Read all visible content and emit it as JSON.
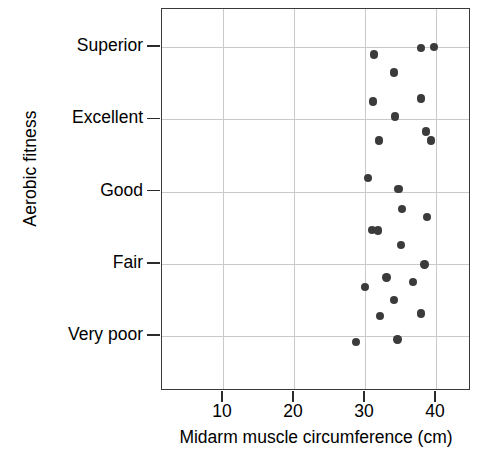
{
  "chart_data": {
    "type": "scatter",
    "title": "",
    "xlabel": "Midarm muscle circumference (cm)",
    "ylabel": "Aerobic fitness",
    "xlim": [
      0,
      43.5
    ],
    "ylim": [
      0.4,
      5.9
    ],
    "grid": true,
    "legend": "none",
    "marker_color": "#3b3b3b",
    "xticks": [
      10,
      20,
      30,
      40
    ],
    "xtick_labels": [
      "10",
      "20",
      "30",
      "40"
    ],
    "yticks": [
      1,
      2,
      3,
      4,
      5
    ],
    "ytick_labels": [
      "Very poor",
      "Fair",
      "Good",
      "Excellent",
      "Superior"
    ],
    "y_categories": [
      "Very poor",
      "Fair",
      "Good",
      "Excellent",
      "Superior"
    ],
    "points": [
      {
        "x": 39.7,
        "y": 5.0,
        "category": "Superior"
      },
      {
        "x": 37.9,
        "y": 4.99,
        "category": "Superior"
      },
      {
        "x": 31.3,
        "y": 4.9,
        "category": "Superior"
      },
      {
        "x": 34.1,
        "y": 4.65,
        "category": "Superior"
      },
      {
        "x": 37.9,
        "y": 4.29,
        "category": "Excellent"
      },
      {
        "x": 31.1,
        "y": 4.25,
        "category": "Excellent"
      },
      {
        "x": 34.2,
        "y": 4.04,
        "category": "Excellent"
      },
      {
        "x": 39.3,
        "y": 3.71,
        "category": "Good"
      },
      {
        "x": 32.0,
        "y": 3.71,
        "category": "Good"
      },
      {
        "x": 38.6,
        "y": 3.83,
        "category": "Good"
      },
      {
        "x": 30.4,
        "y": 3.19,
        "category": "Good"
      },
      {
        "x": 34.7,
        "y": 3.04,
        "category": "Good"
      },
      {
        "x": 35.2,
        "y": 2.76,
        "category": "Good"
      },
      {
        "x": 38.7,
        "y": 2.65,
        "category": "Good"
      },
      {
        "x": 31.8,
        "y": 2.46,
        "category": "Fair"
      },
      {
        "x": 35.1,
        "y": 2.26,
        "category": "Fair"
      },
      {
        "x": 38.4,
        "y": 1.99,
        "category": "Fair"
      },
      {
        "x": 31.0,
        "y": 2.47,
        "category": "Fair"
      },
      {
        "x": 33.0,
        "y": 1.81,
        "category": "Fair"
      },
      {
        "x": 36.8,
        "y": 1.75,
        "category": "Fair"
      },
      {
        "x": 30.0,
        "y": 1.68,
        "category": "Fair"
      },
      {
        "x": 34.1,
        "y": 1.5,
        "category": "Very poor"
      },
      {
        "x": 37.9,
        "y": 1.31,
        "category": "Very poor"
      },
      {
        "x": 32.1,
        "y": 1.28,
        "category": "Very poor"
      },
      {
        "x": 28.7,
        "y": 0.92,
        "category": "Very poor"
      },
      {
        "x": 34.6,
        "y": 0.95,
        "category": "Very poor"
      }
    ]
  }
}
